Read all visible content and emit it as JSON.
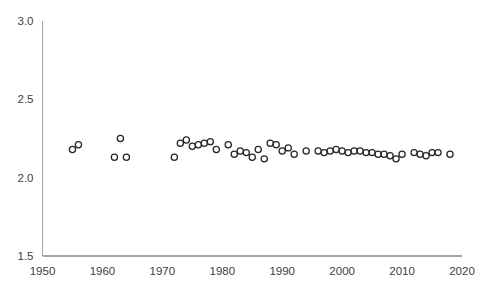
{
  "chart_data": {
    "type": "scatter",
    "title": "",
    "subtitle": "",
    "xlabel": "",
    "ylabel": "",
    "xlim": [
      1950,
      2020
    ],
    "ylim": [
      1.5,
      3.0
    ],
    "xticks": [
      1950,
      1960,
      1970,
      1980,
      1990,
      2000,
      2010,
      2020
    ],
    "xtick_labels": [
      "1950",
      "1960",
      "1970",
      "1980",
      "1990",
      "2000",
      "2010",
      "2020"
    ],
    "yticks": [
      1.5,
      2.0,
      2.5,
      3.0
    ],
    "ytick_labels": [
      "1.5",
      "2.0",
      "2.5",
      "3.0"
    ],
    "grid": false,
    "legend": null,
    "marker_style": "open-circle",
    "marker_color": "#262626",
    "axis_color": "#a6a6a6",
    "series": [
      {
        "name": "series-1",
        "x": [
          1955,
          1956,
          1962,
          1963,
          1964,
          1972,
          1973,
          1974,
          1975,
          1976,
          1977,
          1978,
          1979,
          1981,
          1982,
          1983,
          1984,
          1985,
          1986,
          1987,
          1988,
          1989,
          1990,
          1991,
          1992,
          1994,
          1996,
          1997,
          1998,
          1999,
          2000,
          2001,
          2002,
          2003,
          2004,
          2005,
          2006,
          2007,
          2008,
          2009,
          2010,
          2012,
          2013,
          2014,
          2015,
          2016,
          2018
        ],
        "y": [
          2.18,
          2.21,
          2.13,
          2.25,
          2.13,
          2.13,
          2.22,
          2.24,
          2.2,
          2.21,
          2.22,
          2.23,
          2.18,
          2.21,
          2.15,
          2.17,
          2.16,
          2.13,
          2.18,
          2.12,
          2.22,
          2.21,
          2.17,
          2.19,
          2.15,
          2.17,
          2.17,
          2.16,
          2.17,
          2.18,
          2.17,
          2.16,
          2.17,
          2.17,
          2.16,
          2.16,
          2.15,
          2.15,
          2.14,
          2.12,
          2.15,
          2.16,
          2.15,
          2.14,
          2.16,
          2.16,
          2.15
        ]
      }
    ]
  }
}
